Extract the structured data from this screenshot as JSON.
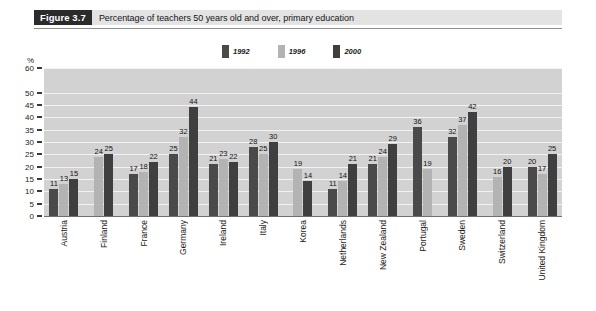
{
  "header": {
    "figure_number": "Figure 3.7",
    "title": "Percentage of teachers 50 years old and over, primary education"
  },
  "axis": {
    "unit_label": "%",
    "y_ticks": [
      "60",
      "50",
      "45",
      "40",
      "35",
      "30",
      "25",
      "20",
      "15",
      "10",
      "5",
      "0"
    ]
  },
  "legend": {
    "items": [
      {
        "label": "1992",
        "color": "#4a4a4a",
        "name": "legend-1992"
      },
      {
        "label": "1996",
        "color": "#b3b3b3",
        "name": "legend-1996"
      },
      {
        "label": "2000",
        "color": "#3f3f3f",
        "name": "legend-2000"
      }
    ]
  },
  "chart_data": {
    "type": "bar",
    "title": "Percentage of teachers 50 years old and over, primary education",
    "xlabel": "",
    "ylabel": "%",
    "ylim": [
      0,
      60
    ],
    "grid": true,
    "legend_position": "top-center",
    "categories": [
      "Austria",
      "Finland",
      "France",
      "Germany",
      "Ireland",
      "Italy",
      "Korea",
      "Netherlands",
      "New Zealand",
      "Portugal",
      "Sweden",
      "Switzerland",
      "United Kingdom"
    ],
    "series": [
      {
        "name": "1992",
        "color": "#4a4a4a",
        "values": [
          11,
          null,
          17,
          25,
          21,
          28,
          null,
          11,
          21,
          36,
          32,
          null,
          20
        ]
      },
      {
        "name": "1996",
        "color": "#b3b3b3",
        "values": [
          13,
          24,
          18,
          32,
          23,
          25,
          19,
          14,
          24,
          19,
          37,
          16,
          17
        ]
      },
      {
        "name": "2000",
        "color": "#3f3f3f",
        "values": [
          15,
          25,
          22,
          44,
          22,
          30,
          14,
          21,
          29,
          null,
          42,
          20,
          25
        ]
      }
    ]
  },
  "colors": {
    "plot_background": "#d2d2d2",
    "gridline": "#f2f2f2",
    "badge_background": "#2b2b2b",
    "title_background": "#e3e3e3"
  }
}
